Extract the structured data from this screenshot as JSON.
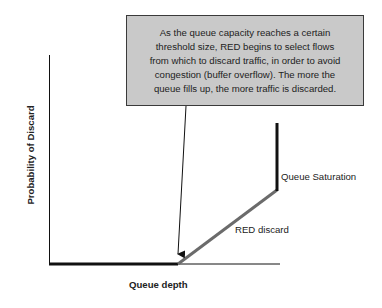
{
  "callout": {
    "lines": [
      "As the queue capacity reaches a certain",
      "threshold size, RED begins to select flows",
      "from which to discard traffic, in order to avoid",
      "congestion (buffer overflow). The more the",
      "queue fills up, the more traffic is discarded."
    ]
  },
  "axes": {
    "x_label": "Queue depth",
    "y_label": "Probability of Discard"
  },
  "annotations": {
    "red_discard": "RED discard",
    "queue_saturation": "Queue Saturation"
  },
  "colors": {
    "callout_fill": "#c9c9c9",
    "callout_border": "#3a3a3a",
    "red_discard_line": "#6b6b6b",
    "axis": "#111111"
  }
}
